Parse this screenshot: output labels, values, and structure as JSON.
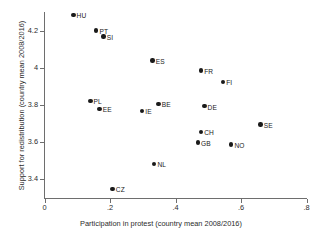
{
  "chart_data": {
    "type": "scatter",
    "title": "",
    "xlabel": "Participation in protest (country mean 2008/2016)",
    "ylabel": "Support for redistribution (country mean 2008/2016)",
    "xlim": [
      0,
      0.8
    ],
    "ylim": [
      3.3,
      4.3
    ],
    "xticks": [
      "0",
      ".2",
      ".4",
      ".6",
      ".8"
    ],
    "xtick_values": [
      0,
      0.2,
      0.4,
      0.6,
      0.8
    ],
    "yticks": [
      "3.4",
      "3.6",
      "3.8",
      "4",
      "4.2"
    ],
    "ytick_values": [
      3.4,
      3.6,
      3.8,
      4.0,
      4.2
    ],
    "grid": false,
    "legend": "none",
    "marker_color": "#1a1a1a",
    "points": [
      {
        "label": "HU",
        "x": 0.088,
        "y": 4.283
      },
      {
        "label": "PT",
        "x": 0.158,
        "y": 4.2
      },
      {
        "label": "SI",
        "x": 0.18,
        "y": 4.168
      },
      {
        "label": "ES",
        "x": 0.33,
        "y": 4.04
      },
      {
        "label": "FR",
        "x": 0.478,
        "y": 3.985
      },
      {
        "label": "FI",
        "x": 0.545,
        "y": 3.925
      },
      {
        "label": "PL",
        "x": 0.14,
        "y": 3.823
      },
      {
        "label": "EE",
        "x": 0.168,
        "y": 3.78
      },
      {
        "label": "IE",
        "x": 0.298,
        "y": 3.768
      },
      {
        "label": "BE",
        "x": 0.348,
        "y": 3.805
      },
      {
        "label": "DE",
        "x": 0.488,
        "y": 3.793
      },
      {
        "label": "SE",
        "x": 0.66,
        "y": 3.695
      },
      {
        "label": "CH",
        "x": 0.478,
        "y": 3.655
      },
      {
        "label": "GB",
        "x": 0.468,
        "y": 3.598
      },
      {
        "label": "NO",
        "x": 0.57,
        "y": 3.588
      },
      {
        "label": "NL",
        "x": 0.335,
        "y": 3.483
      },
      {
        "label": "CZ",
        "x": 0.208,
        "y": 3.348
      }
    ]
  }
}
